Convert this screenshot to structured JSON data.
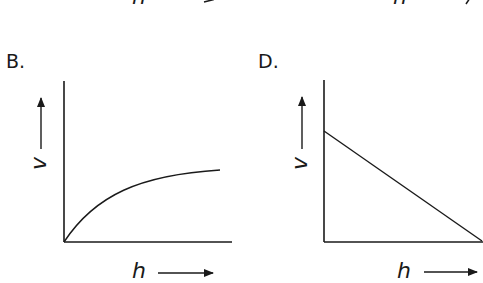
{
  "top_strip": {
    "left_label": "h",
    "right_label": "h"
  },
  "panels": [
    {
      "id": "B",
      "label": "B.",
      "x_axis_label": "h",
      "y_axis_label": "v",
      "curve": "concave increasing from origin, leveling off"
    },
    {
      "id": "D",
      "label": "D.",
      "x_axis_label": "h",
      "y_axis_label": "v",
      "curve": "straight line decreasing from positive v-intercept to zero at max h"
    }
  ],
  "colors": {
    "ink": "#1a1a1a",
    "background": "#ffffff"
  }
}
